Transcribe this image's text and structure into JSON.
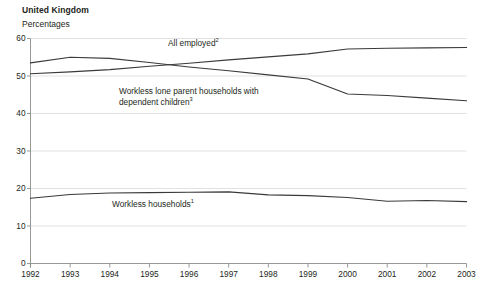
{
  "header": {
    "region_title": "United Kingdom",
    "units_label": "Percentages"
  },
  "labels": {
    "all_employed": "All employed",
    "all_employed_note": "2",
    "lone_parent_line1": "Workless lone parent households with",
    "lone_parent_line2": "dependent children",
    "lone_parent_note": "3",
    "workless_households": "Workless households",
    "workless_households_note": "1"
  },
  "colors": {
    "line": "#3a3a3a",
    "grid": "#d9d9d9",
    "axis": "#8c8c8c",
    "text": "#231f20"
  },
  "chart_data": {
    "type": "line",
    "title": "United Kingdom",
    "subtitle": "Percentages",
    "xlabel": "",
    "ylabel": "Percentages",
    "x": [
      1992,
      1993,
      1994,
      1995,
      1996,
      1997,
      1998,
      1999,
      2000,
      2001,
      2002,
      2003
    ],
    "categories": [
      "1992",
      "1993",
      "1994",
      "1995",
      "1996",
      "1997",
      "1998",
      "1999",
      "2000",
      "2001",
      "2002",
      "2003"
    ],
    "xlim": [
      1992,
      2003
    ],
    "ylim": [
      0,
      60
    ],
    "yticks": [
      0,
      10,
      20,
      30,
      40,
      50,
      60
    ],
    "grid": true,
    "legend": "inline-annotations",
    "series": [
      {
        "name": "All employed",
        "note": "2",
        "values": [
          50.6,
          51.1,
          51.7,
          52.6,
          53.4,
          54.3,
          55.1,
          55.9,
          57.2,
          57.4,
          57.5,
          57.6
        ]
      },
      {
        "name": "Workless lone parent households with dependent children",
        "note": "3",
        "values": [
          53.5,
          55.0,
          54.7,
          53.6,
          52.4,
          51.4,
          50.3,
          49.2,
          45.2,
          44.8,
          44.1,
          43.4
        ]
      },
      {
        "name": "Workless households",
        "note": "1",
        "values": [
          17.4,
          18.4,
          18.8,
          18.9,
          19.0,
          19.1,
          18.3,
          18.1,
          17.6,
          16.6,
          16.8,
          16.5
        ]
      }
    ]
  }
}
